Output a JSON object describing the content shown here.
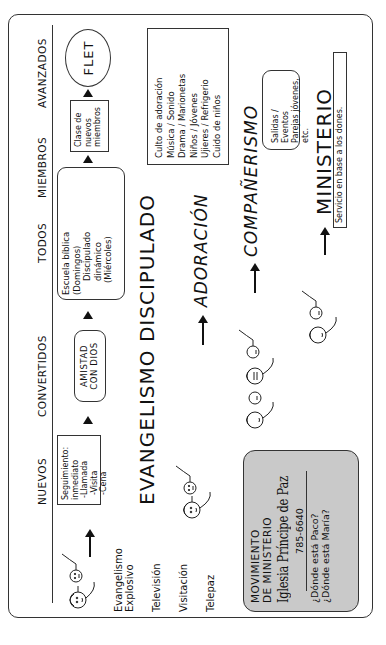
{
  "headings": {
    "nuevos": "NUEVOS",
    "convertidos": "CONVERTIDOS",
    "todos": "TODOS",
    "miembros": "MIEMBROS",
    "avanzados": "AVANZADOS"
  },
  "steps": {
    "seguimiento": [
      "Seguimiento:",
      "inmediato",
      "-Llamada",
      "-Visita",
      "-Cena"
    ],
    "amistad": [
      "AMISTAD",
      "CON DIOS"
    ],
    "escuela": [
      "Escuela bíblica",
      "(Domingos)",
      "Discipulado",
      "dinámico",
      "(Miércoles)"
    ],
    "clase": [
      "Clase de",
      "nuevos",
      "miembros"
    ],
    "flet": "FLET"
  },
  "outreach": {
    "items": [
      "Evangelismo",
      "Explosivo",
      "Televisión",
      "Visitación",
      "Telepaz"
    ]
  },
  "pillars": {
    "evangelismo": "EVANGELISMO",
    "discipulado": "DISCIPULADO",
    "adoracion": "ADORACIÓN",
    "companerismo": "COMPAÑERISMO",
    "ministerio": "MINISTERIO"
  },
  "adoracion_box": [
    "Culto de adoración",
    "Música / Sonido",
    "Drama / Marionetas",
    "Niños / Jóvenes",
    "Ujieres / Refrigerio",
    "Cuido de niños"
  ],
  "companerismo_box": [
    "Salidas / Eventos",
    "Parejas jóvenes, etc."
  ],
  "ministerio_box": "Servicio en base a los dones.",
  "church_box": {
    "title_line1": "MOVIMIENTO",
    "title_line2": "DE MINISTERIO",
    "church_name": "Iglesia Príncipe de Paz",
    "phone": "785-6640",
    "question1": "¿Dónde está Paco?",
    "question2": "¿Dónde está María?"
  },
  "colors": {
    "ink": "#111111",
    "church_box_fill": "#c9c9c9",
    "paper": "#ffffff"
  },
  "orientation": "rotated 90° counter-clockwise"
}
